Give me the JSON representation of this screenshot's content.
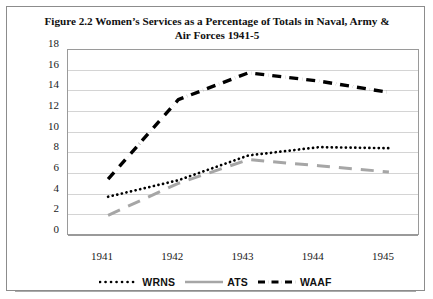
{
  "figure": {
    "title": "Figure 2.2 Women’s Services as a Percentage of Totals in Naval, Army & Air Forces 1941-5"
  },
  "chart_data": {
    "type": "line",
    "title": "Figure 2.2 Women’s Services as a Percentage of Totals in Naval, Army & Air Forces 1941-5",
    "xlabel": "",
    "ylabel": "",
    "categories": [
      "1941",
      "1942",
      "1943",
      "1944",
      "1945"
    ],
    "ylim": [
      0,
      18
    ],
    "yticks": [
      0,
      2,
      4,
      6,
      8,
      10,
      12,
      14,
      16,
      18
    ],
    "grid": "horizontal",
    "legend_position": "bottom",
    "series": [
      {
        "name": "WRNS",
        "style": "dotted",
        "color": "#000000",
        "values": [
          3.7,
          5.3,
          7.7,
          8.5,
          8.4
        ]
      },
      {
        "name": "ATS",
        "style": "dashed",
        "color": "#a6a6a6",
        "values": [
          1.9,
          5.0,
          7.3,
          6.7,
          6.1
        ]
      },
      {
        "name": "WAAF",
        "style": "dash-dot",
        "color": "#000000",
        "values": [
          5.4,
          13.1,
          15.7,
          14.9,
          13.8
        ]
      }
    ]
  },
  "axis": {
    "y_ticks": [
      "18",
      "16",
      "14",
      "12",
      "10",
      "8",
      "6",
      "4",
      "2",
      "0"
    ],
    "x_ticks": [
      "1941",
      "1942",
      "1943",
      "1944",
      "1945"
    ]
  },
  "legend": {
    "items": [
      {
        "label": "WRNS",
        "icon": "dotted-line-swatch"
      },
      {
        "label": "ATS",
        "icon": "solid-gray-line-swatch"
      },
      {
        "label": "WAAF",
        "icon": "dash-dot-line-swatch"
      }
    ]
  }
}
